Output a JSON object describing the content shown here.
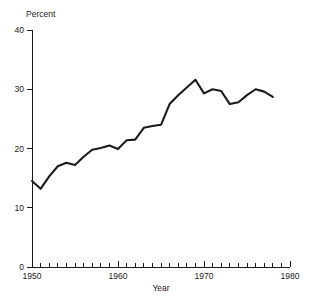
{
  "chart_data": {
    "type": "line",
    "title": "",
    "xlabel": "Year",
    "ylabel": "Percent",
    "xlim": [
      1950,
      1980
    ],
    "ylim": [
      0,
      40
    ],
    "grid": false,
    "legend": null,
    "x_ticks": [
      1950,
      1960,
      1970,
      1980
    ],
    "x_tick_labels": [
      "1950",
      "1960",
      "1970",
      "1980"
    ],
    "x_minor_tick_interval": 1,
    "y_ticks": [
      0,
      10,
      20,
      30,
      40
    ],
    "y_tick_labels": [
      "0",
      "10",
      "20",
      "30",
      "40"
    ],
    "line_color": "#1a1a1a",
    "series": [
      {
        "name": "Percent",
        "x": [
          1950,
          1951,
          1952,
          1953,
          1954,
          1955,
          1956,
          1957,
          1958,
          1959,
          1960,
          1961,
          1962,
          1963,
          1964,
          1965,
          1966,
          1967,
          1968,
          1969,
          1970,
          1971,
          1972,
          1973,
          1974,
          1975,
          1976,
          1977,
          1978
        ],
        "values": [
          14.5,
          13.2,
          15.3,
          17.0,
          17.6,
          17.2,
          18.6,
          19.8,
          20.1,
          20.5,
          19.9,
          21.4,
          21.5,
          23.5,
          23.8,
          24.0,
          27.5,
          29.0,
          30.3,
          31.6,
          29.3,
          30.0,
          29.7,
          27.5,
          27.8,
          29.0,
          30.0,
          29.6,
          28.7
        ]
      }
    ]
  },
  "labels": {
    "y_axis_title": "Percent",
    "x_axis_title": "Year"
  }
}
